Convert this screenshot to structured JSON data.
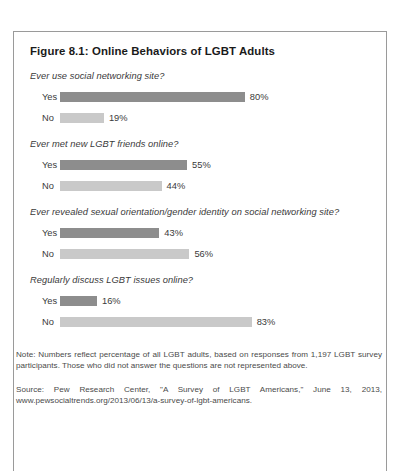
{
  "figure": {
    "title": "Figure 8.1: Online Behaviors of LGBT Adults",
    "note": "Note: Numbers reflect percentage of all LGBT adults, based on responses from 1,197 LGBT survey participants. Those who did not answer the questions are not represented above.",
    "source": "Source: Pew Research Center, \"A Survey of LGBT Americans,\" June 13, 2013, www.pewsocialtrends.org/2013/06/13/a-survey-of-lgbt-americans."
  },
  "colors": {
    "yes_bar": "#8d8d8d",
    "no_bar": "#c9c9c9",
    "border": "#9a9a9a",
    "text": "#3a3a3a"
  },
  "chart_data": {
    "type": "bar",
    "title": "Figure 8.1: Online Behaviors of LGBT Adults",
    "orientation": "horizontal",
    "xlabel": "",
    "ylabel": "",
    "xlim": [
      0,
      100
    ],
    "grid": false,
    "legend": false,
    "units": "percent",
    "series": [
      {
        "name": "Yes",
        "color": "#8d8d8d"
      },
      {
        "name": "No",
        "color": "#c9c9c9"
      }
    ],
    "groups": [
      {
        "question": "Ever use social networking site?",
        "rows": [
          {
            "label": "Yes",
            "value": 80,
            "value_label": "80%",
            "series": "yes"
          },
          {
            "label": "No",
            "value": 19,
            "value_label": "19%",
            "series": "no"
          }
        ]
      },
      {
        "question": "Ever met new LGBT friends online?",
        "rows": [
          {
            "label": "Yes",
            "value": 55,
            "value_label": "55%",
            "series": "yes"
          },
          {
            "label": "No",
            "value": 44,
            "value_label": "44%",
            "series": "no"
          }
        ]
      },
      {
        "question": "Ever revealed sexual orientation/gender identity on social networking site?",
        "rows": [
          {
            "label": "Yes",
            "value": 43,
            "value_label": "43%",
            "series": "yes"
          },
          {
            "label": "No",
            "value": 56,
            "value_label": "56%",
            "series": "no"
          }
        ]
      },
      {
        "question": "Regularly discuss LGBT issues online?",
        "rows": [
          {
            "label": "Yes",
            "value": 16,
            "value_label": "16%",
            "series": "yes"
          },
          {
            "label": "No",
            "value": 83,
            "value_label": "83%",
            "series": "no"
          }
        ]
      }
    ],
    "annotations": [
      "Note: Numbers reflect percentage of all LGBT adults, based on responses from 1,197 LGBT survey participants. Those who did not answer the questions are not represented above.",
      "Source: Pew Research Center, \"A Survey of LGBT Americans,\" June 13, 2013, www.pewsocialtrends.org/2013/06/13/a-survey-of-lgbt-americans."
    ]
  }
}
